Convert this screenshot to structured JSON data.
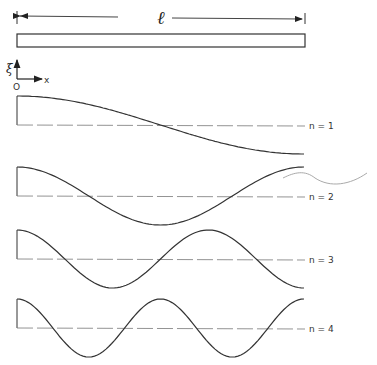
{
  "figure": {
    "length_label": "ℓ",
    "axis": {
      "vertical_label": "ξ",
      "horizontal_label": "x",
      "origin_label": "O"
    },
    "modes": [
      {
        "label": "n = 1",
        "n": 1
      },
      {
        "label": "n = 2",
        "n": 2
      },
      {
        "label": "n = 3",
        "n": 3
      },
      {
        "label": "n = 4",
        "n": 4
      }
    ],
    "colors": {
      "line": "#333333",
      "dash": "#777777",
      "scribble": "#999999"
    }
  }
}
